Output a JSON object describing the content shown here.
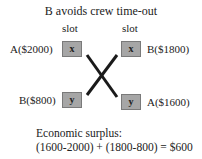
{
  "title": "B avoids crew time-out",
  "slots": {
    "left_label": "slot",
    "right_label": "slot"
  },
  "rows": [
    {
      "left_label": "A($2000)",
      "left_box": "x",
      "right_box": "x",
      "right_label": "B($1800)"
    },
    {
      "left_label": "B($800)",
      "left_box": "y",
      "right_box": "y",
      "right_label": "A($1600)"
    }
  ],
  "surplus": {
    "heading": "Economic surplus:",
    "formula": "(1600-2000) + (1800-800) = $600"
  },
  "colors": {
    "box_fill": "#a6a6a6",
    "line": "#1a1a1a"
  }
}
